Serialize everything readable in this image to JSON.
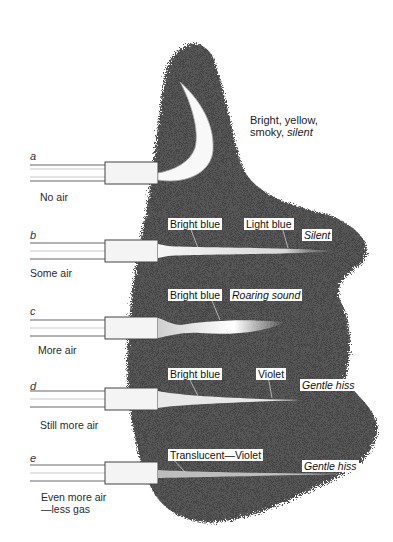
{
  "top_description": {
    "line1": "Bright, yellow,",
    "line2_plain": "smoky, ",
    "line2_italic": "silent"
  },
  "burners": [
    {
      "letter": "a",
      "caption": "No air",
      "labels": []
    },
    {
      "letter": "b",
      "caption": "Some air",
      "labels": [
        {
          "text": "Bright blue",
          "italic": false
        },
        {
          "text": "Light blue",
          "italic": false
        },
        {
          "text": "Silent",
          "italic": true
        }
      ]
    },
    {
      "letter": "c",
      "caption": "More air",
      "labels": [
        {
          "text": "Bright blue",
          "italic": false
        },
        {
          "text": "Roaring sound",
          "italic": true
        }
      ]
    },
    {
      "letter": "d",
      "caption": "Still more air",
      "labels": [
        {
          "text": "Bright blue",
          "italic": false
        },
        {
          "text": "Violet",
          "italic": false
        },
        {
          "text": "Gentle hiss",
          "italic": true
        }
      ]
    },
    {
      "letter": "e",
      "caption_line1": "Even more air",
      "caption_line2": "—less gas",
      "labels": [
        {
          "text": "Translucent—Violet",
          "italic": false
        },
        {
          "text": "Gentle hiss",
          "italic": true
        }
      ]
    }
  ],
  "colors": {
    "background": "#ffffff",
    "shading": "#3a3a3a",
    "tube": "#f4f4f4"
  }
}
